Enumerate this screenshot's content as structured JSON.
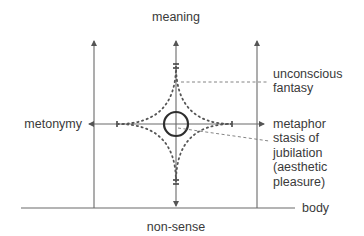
{
  "diagram": {
    "labels": {
      "top": "meaning",
      "bottom": "non-sense",
      "left": "metonymy",
      "baseline": "body",
      "fantasy": [
        "unconscious",
        "fantasy"
      ],
      "metaphor": "metaphor",
      "stasis": [
        "stasis of",
        "jubilation",
        "(aesthetic",
        "pleasure)"
      ]
    },
    "colors": {
      "line": "#6a6a6a",
      "dots": "#555555",
      "circle": "#2e2e2e",
      "text": "#3a3a3a"
    }
  }
}
